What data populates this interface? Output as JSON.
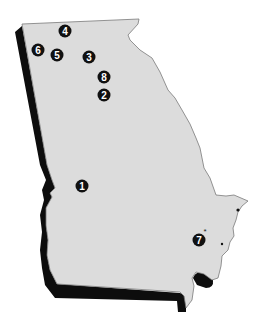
{
  "map": {
    "region": "Georgia",
    "colors": {
      "fill": "#dcdcdc",
      "shadow": "#0d0d0d",
      "border": "#7a7a7a",
      "marker": "#111111",
      "marker_text": "#ffffff",
      "background": "#ffffff"
    },
    "markers": [
      {
        "id": "1",
        "label": "1",
        "x": 82,
        "y": 186
      },
      {
        "id": "2",
        "label": "2",
        "x": 104,
        "y": 95
      },
      {
        "id": "3",
        "label": "3",
        "x": 89,
        "y": 57
      },
      {
        "id": "4",
        "label": "4",
        "x": 65,
        "y": 31
      },
      {
        "id": "5",
        "label": "5",
        "x": 57,
        "y": 55
      },
      {
        "id": "6",
        "label": "6",
        "x": 38,
        "y": 50
      },
      {
        "id": "7",
        "label": "7",
        "x": 199,
        "y": 240
      },
      {
        "id": "8",
        "label": "8",
        "x": 104,
        "y": 77
      }
    ],
    "annotations": [
      {
        "type": "asterisk",
        "symbol": "*",
        "x": 205,
        "y": 231
      }
    ]
  }
}
